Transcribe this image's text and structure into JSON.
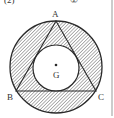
{
  "figure": {
    "header_fragment_left": "(2)",
    "header_fragment_right": "②",
    "labels": {
      "A": "A",
      "B": "B",
      "C": "C",
      "G": "G"
    },
    "colors": {
      "stroke": "#2a2a2a",
      "hatch": "#555555",
      "background": "#ffffff"
    }
  }
}
